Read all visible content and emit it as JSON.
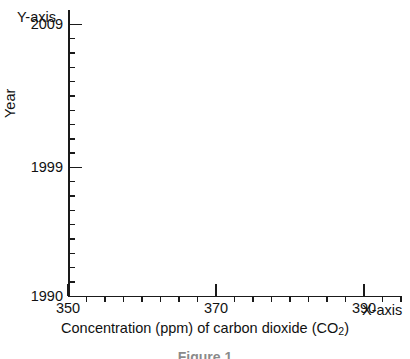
{
  "figure": {
    "caption": "Figure 1",
    "background_color": "#ffffff",
    "ink_color": "#1a1a1a"
  },
  "callouts": {
    "y_axis_label": "Y-axis",
    "x_axis_label": "X-axis"
  },
  "axis_titles": {
    "y": "Year",
    "x_main": "Concentration (ppm) of carbon dioxide (CO",
    "x_subscript": "2",
    "x_tail": ")"
  },
  "chart_data": {
    "type": "line",
    "title": "",
    "subtitle": "",
    "xlabel": "Concentration (ppm) of carbon dioxide (CO2)",
    "ylabel": "Year",
    "xlim": [
      350,
      395
    ],
    "ylim": [
      1990,
      2010
    ],
    "x_major_ticks": [
      350,
      370,
      390
    ],
    "x_major_tick_labels": [
      "350",
      "370",
      "390"
    ],
    "x_minor_tick_step": 2.5,
    "x_minor_ticks": [
      352.5,
      355,
      357.5,
      360,
      362.5,
      365,
      367.5,
      372.5,
      375,
      377.5,
      380,
      382.5,
      385,
      387.5,
      392.5,
      395
    ],
    "y_major_ticks": [
      1990,
      1999,
      2009
    ],
    "y_major_tick_labels": [
      "1990",
      "1999",
      "2009"
    ],
    "y_minor_tick_step": 1,
    "y_minor_ticks": [
      1991,
      1992,
      1993,
      1994,
      1995,
      1996,
      1997,
      1998,
      2000,
      2001,
      2002,
      2003,
      2004,
      2005,
      2006,
      2007,
      2008
    ],
    "grid": false,
    "legend": false,
    "legend_position": "none",
    "series": [],
    "annotations": [
      "Y-axis",
      "X-axis"
    ],
    "note": "Blank axes template — no data points are plotted in the figure."
  }
}
